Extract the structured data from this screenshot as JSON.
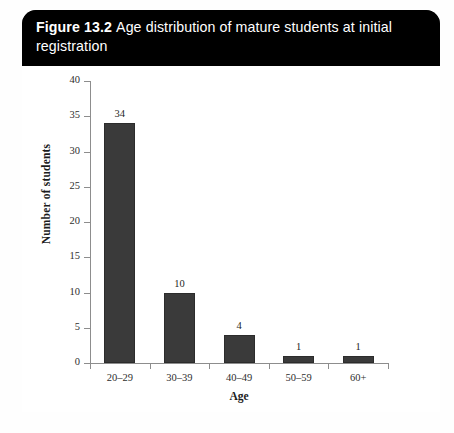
{
  "figure": {
    "label": "Figure 13.2",
    "caption": "Age distribution of mature students at initial registration",
    "border_color": "#2b2b2b",
    "banner_color": "#000000",
    "banner_text_color": "#ffffff"
  },
  "chart_data": {
    "type": "bar",
    "title": "Age distribution of mature students at initial registration",
    "categories": [
      "20–29",
      "30–39",
      "40–49",
      "50–59",
      "60+"
    ],
    "values": [
      34,
      10,
      4,
      1,
      1
    ],
    "value_labels": [
      "34",
      "10",
      "4",
      "1",
      "1"
    ],
    "xlabel": "Age",
    "ylabel": "Number of students",
    "ylim": [
      0,
      40
    ],
    "ytick_step": 5,
    "yticks": [
      0,
      5,
      10,
      15,
      20,
      25,
      30,
      35,
      40
    ],
    "ytick_labels": [
      "0",
      "5",
      "10",
      "15",
      "20",
      "25",
      "30",
      "35",
      "40"
    ],
    "grid": false,
    "legend": false,
    "bar_color": "#3a3a3a",
    "axis_color": "#8d8d8d"
  }
}
